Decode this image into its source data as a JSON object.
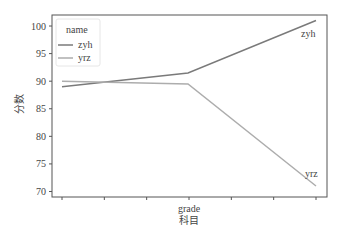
{
  "chart_data": {
    "type": "line",
    "title": "",
    "xlabel": "grade\n科目",
    "xlabel_lines": [
      "grade",
      "科目"
    ],
    "ylabel": "分数",
    "ylim": [
      69,
      102
    ],
    "yticks": [
      70,
      75,
      80,
      85,
      90,
      95,
      100
    ],
    "x_tick_count": 7,
    "grid": false,
    "legend": {
      "title": "name",
      "position": "upper left",
      "entries": [
        "zyh",
        "yrz"
      ]
    },
    "x": [
      0,
      1,
      2
    ],
    "series": [
      {
        "name": "zyh",
        "values": [
          89,
          91.5,
          101
        ],
        "color": "#7a7a7a"
      },
      {
        "name": "yrz",
        "values": [
          90,
          89.5,
          71
        ],
        "color": "#adadad"
      }
    ],
    "annotations": [
      {
        "text": "zyh",
        "x": 2,
        "y": 99
      },
      {
        "text": "yrz",
        "x": 2,
        "y": 72.5
      }
    ]
  }
}
